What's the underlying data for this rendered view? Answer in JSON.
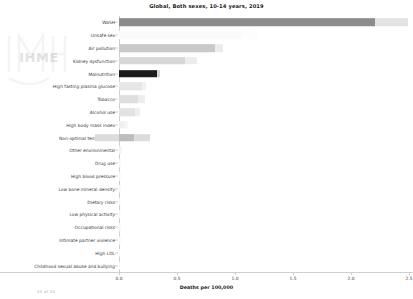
{
  "chart_data": {
    "type": "bar",
    "orientation": "horizontal",
    "title": "Global, Both sexes, 10-14 years, 2019",
    "xlabel": "Deaths per 100,000",
    "ylabel": "",
    "xlim": [
      -0.22,
      2.68
    ],
    "xticks": [
      "0.0",
      "0.5",
      "1.0",
      "1.5",
      "2.0",
      "2.5"
    ],
    "xtick_values": [
      0.0,
      0.5,
      1.0,
      1.5,
      2.0,
      2.5
    ],
    "grid": false,
    "legend": "none",
    "categories": [
      "WaSH",
      "Unsafe sex",
      "Air pollution",
      "Kidney dysfunction",
      "Malnutrition",
      "High fasting plasma glucose",
      "Tobacco",
      "Alcohol use",
      "High body mass index",
      "Non-optimal temperature",
      "Other environmental",
      "Drug use",
      "High blood pressure",
      "Low bone mineral density",
      "Dietary risks",
      "Low physical activity",
      "Occupational risks",
      "Intimate partner violence",
      "High LDL",
      "Childhood sexual abuse and bullying"
    ],
    "values": [
      2.21,
      1.06,
      0.83,
      0.57,
      0.33,
      0.2,
      0.16,
      0.14,
      0.05,
      0.13,
      0.02,
      0.01,
      0.01,
      0.01,
      0.01,
      0.01,
      0.01,
      0.01,
      0.0,
      0.0
    ],
    "upper_values": [
      2.49,
      1.2,
      0.9,
      0.67,
      0.35,
      0.23,
      0.22,
      0.18,
      0.08,
      0.27,
      0.03,
      0.02,
      0.02,
      0.02,
      0.02,
      0.02,
      0.02,
      0.02,
      0.01,
      0.01
    ],
    "lower_values": [
      0.0,
      0.0,
      0.0,
      0.0,
      0.0,
      0.0,
      0.0,
      0.0,
      0.0,
      -0.21,
      0.0,
      0.0,
      0.0,
      0.0,
      0.0,
      0.0,
      0.0,
      0.0,
      0.0,
      0.0
    ],
    "bar_colors": [
      "#8c8c8c",
      "#fbfbfb",
      "#c9c9c9",
      "#d8d8d8",
      "#1c1c1c",
      "#e6e6e6",
      "#dedede",
      "#e2e2e2",
      "#f0f0f0",
      "#bdbdbd",
      "#f2f2f2",
      "#f5f5f5",
      "#f5f5f5",
      "#f5f5f5",
      "#f5f5f5",
      "#f5f5f5",
      "#f5f5f5",
      "#f5f5f5",
      "#f8f8f8",
      "#f8f8f8"
    ],
    "interval_colors": [
      "#e3e3e3",
      "#fdfdfd",
      "#ebebeb",
      "#ededed",
      "#d4d4d4",
      "#f1f1f1",
      "#eeeeee",
      "#efefef",
      "#f6f6f6",
      "#dcdcdc",
      "#f7f7f7",
      "#fafafa",
      "#fafafa",
      "#fafafa",
      "#fafafa",
      "#fafafa",
      "#fafafa",
      "#fafafa",
      "#fcfcfc",
      "#fcfcfc"
    ]
  },
  "watermark": {
    "brand": "IHME",
    "page_counter": "20 of 20"
  },
  "colors": {
    "axis": "#cfcfcf",
    "text": "#3a3a3a",
    "title": "#1a1a1a"
  }
}
